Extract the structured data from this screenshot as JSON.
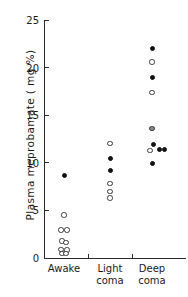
{
  "chart_data": {
    "type": "scatter",
    "title": "",
    "xlabel": "",
    "ylabel": "Plasma  meprobamate  ( mg  %)",
    "ylim": [
      0,
      25
    ],
    "yticks": [
      0,
      5,
      10,
      15,
      20,
      25
    ],
    "ytick_labels": [
      "0",
      "5",
      "10",
      "15",
      "20",
      "25"
    ],
    "grid": false,
    "legend": "none",
    "categories": [
      "Awake",
      "Light\ncoma",
      "Deep\ncoma"
    ],
    "marker_types": [
      "filled",
      "open",
      "half"
    ],
    "series": [
      {
        "name": "Awake",
        "category_index": 0,
        "points": [
          {
            "value": 8.7,
            "marker": "filled",
            "offset": 0
          },
          {
            "value": 4.5,
            "marker": "open",
            "offset": 0
          },
          {
            "value": 2.95,
            "marker": "open",
            "offset": -3
          },
          {
            "value": 2.95,
            "marker": "open",
            "offset": 3
          },
          {
            "value": 1.8,
            "marker": "open",
            "offset": -2
          },
          {
            "value": 1.6,
            "marker": "open",
            "offset": 2
          },
          {
            "value": 0.9,
            "marker": "open",
            "offset": -3
          },
          {
            "value": 0.85,
            "marker": "open",
            "offset": 3
          },
          {
            "value": 0.5,
            "marker": "open",
            "offset": -2
          },
          {
            "value": 0.45,
            "marker": "open",
            "offset": 2
          }
        ]
      },
      {
        "name": "Light coma",
        "category_index": 1,
        "points": [
          {
            "value": 12.0,
            "marker": "open",
            "offset": 0
          },
          {
            "value": 10.5,
            "marker": "filled",
            "offset": 0
          },
          {
            "value": 9.2,
            "marker": "filled",
            "offset": 0
          },
          {
            "value": 7.8,
            "marker": "open",
            "offset": 0
          },
          {
            "value": 7.0,
            "marker": "open",
            "offset": 0
          },
          {
            "value": 6.3,
            "marker": "open",
            "offset": 0
          }
        ]
      },
      {
        "name": "Deep coma",
        "category_index": 2,
        "points": [
          {
            "value": 22.0,
            "marker": "filled",
            "offset": 0
          },
          {
            "value": 20.6,
            "marker": "open",
            "offset": 0
          },
          {
            "value": 19.0,
            "marker": "filled",
            "offset": 0
          },
          {
            "value": 17.4,
            "marker": "open",
            "offset": 0
          },
          {
            "value": 13.6,
            "marker": "half",
            "offset": 0
          },
          {
            "value": 11.9,
            "marker": "filled",
            "offset": 1
          },
          {
            "value": 11.3,
            "marker": "open",
            "offset": -2
          },
          {
            "value": 11.4,
            "marker": "filled",
            "offset": 7
          },
          {
            "value": 11.35,
            "marker": "filled",
            "offset": 12
          },
          {
            "value": 9.95,
            "marker": "filled",
            "offset": 0
          }
        ]
      }
    ]
  },
  "axes": {
    "y_axis_x": 44,
    "x_axis_y": 258,
    "y_top_px": 20,
    "plot_right": 186,
    "category_centers": [
      64,
      110,
      152
    ],
    "x_separators": [
      88,
      132
    ]
  }
}
